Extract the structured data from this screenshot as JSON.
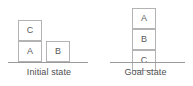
{
  "diagram": {
    "type": "blocks-world-state-diagram",
    "background_color": "#ffffff",
    "block_border_color": "#b3b3b3",
    "ground_line_color": "#9a9a9a",
    "text_color": "#59595b",
    "scenes": [
      {
        "id": "initial",
        "caption": "Initial state",
        "stacks": [
          {
            "id": "stack-left",
            "blocks_bottom_to_top": [
              "A",
              "C"
            ]
          },
          {
            "id": "stack-right",
            "blocks_bottom_to_top": [
              "B"
            ]
          }
        ],
        "blocks": [
          {
            "label": "C",
            "stack": "stack-left",
            "level": 2
          },
          {
            "label": "A",
            "stack": "stack-left",
            "level": 1
          },
          {
            "label": "B",
            "stack": "stack-right",
            "level": 1
          }
        ]
      },
      {
        "id": "goal",
        "caption": "Goal state",
        "stacks": [
          {
            "id": "stack-center",
            "blocks_bottom_to_top": [
              "C",
              "B",
              "A"
            ]
          }
        ],
        "blocks": [
          {
            "label": "A",
            "stack": "stack-center",
            "level": 3
          },
          {
            "label": "B",
            "stack": "stack-center",
            "level": 2
          },
          {
            "label": "C",
            "stack": "stack-center",
            "level": 1
          }
        ]
      }
    ]
  }
}
